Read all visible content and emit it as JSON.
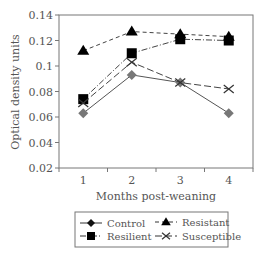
{
  "chart_data": {
    "type": "line",
    "title": "",
    "xlabel": "Months post-weaning",
    "ylabel": "Optical density units",
    "categories": [
      "1",
      "2",
      "3",
      "4"
    ],
    "ylim": [
      0.02,
      0.14
    ],
    "yticks": [
      "0.02",
      "0.04",
      "0.06",
      "0.08",
      "0.1",
      "0.12",
      "0.14"
    ],
    "grid": false,
    "legend_position": "bottom",
    "series": [
      {
        "name": "Control",
        "marker": "diamond",
        "line": "solid",
        "color": "#777777",
        "values": [
          0.063,
          0.093,
          0.087,
          0.063
        ]
      },
      {
        "name": "Resistant",
        "marker": "triangle",
        "line": "dashed",
        "color": "#000000",
        "values": [
          0.112,
          0.127,
          0.125,
          0.123
        ]
      },
      {
        "name": "Resilient",
        "marker": "square",
        "line": "dash-dot",
        "color": "#000000",
        "values": [
          0.074,
          0.11,
          0.121,
          0.12
        ]
      },
      {
        "name": "Susceptible",
        "marker": "x",
        "line": "long-dash",
        "color": "#333333",
        "values": [
          0.071,
          0.103,
          0.087,
          0.082
        ]
      }
    ]
  }
}
